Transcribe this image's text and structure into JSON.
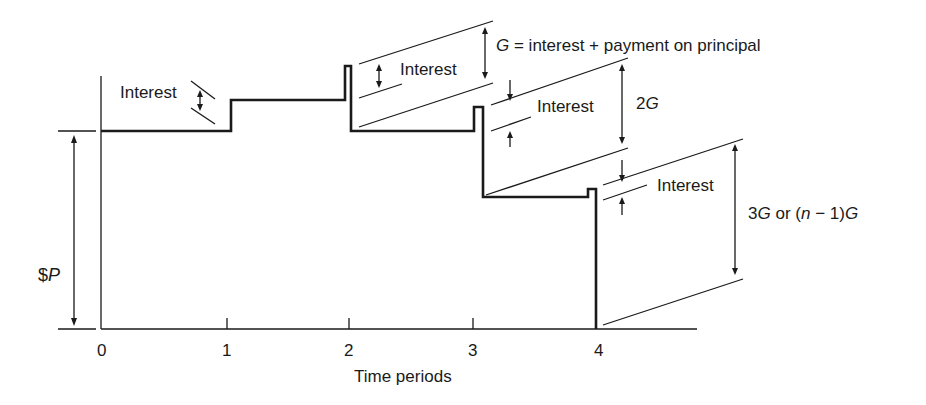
{
  "diagram": {
    "y_label_prefix": "$",
    "y_label_var": "P",
    "x_axis_title": "Time periods",
    "x_ticks": [
      "0",
      "1",
      "2",
      "3",
      "4"
    ],
    "labels": {
      "interest_1": "Interest",
      "interest_2": "Interest",
      "interest_3": "Interest",
      "interest_4": "Interest",
      "g_var": "G",
      "g_definition": " = interest + payment on principal",
      "two_g_num": "2",
      "two_g_var": "G",
      "three_g_num": "3",
      "three_g_var": "G",
      "three_g_or": " or (",
      "n_var": "n",
      "n_minus": " − 1)",
      "n_g_var": "G"
    },
    "colors": {
      "line": "#1a1a1a",
      "background": "#ffffff"
    }
  }
}
